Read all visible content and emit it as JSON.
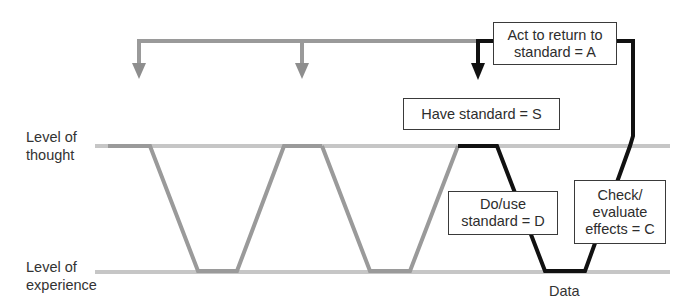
{
  "diagram": {
    "levels": {
      "thought": "Level of\nthought",
      "experience": "Level of\nexperience"
    },
    "boxes": {
      "act": "Act to return to\nstandard = A",
      "standard": "Have standard = S",
      "do": "Do/use\nstandard = D",
      "check": "Check/\nevaluate\neffects = C"
    },
    "data_label": "Data",
    "colors": {
      "gray_path": "#9a9a9a",
      "level_line": "#c4c4c4",
      "active_path": "#111111",
      "box_border": "#3a3a3a"
    },
    "cycles": [
      {
        "name": "past-cycle-1",
        "active": false
      },
      {
        "name": "past-cycle-2",
        "active": false
      },
      {
        "name": "current-cycle",
        "active": true
      }
    ]
  }
}
